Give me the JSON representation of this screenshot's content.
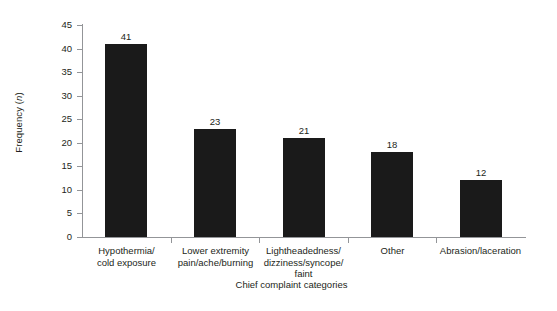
{
  "chart_data": {
    "type": "bar",
    "title": "",
    "subtitle": "",
    "xlabel": "Chief complaint categories",
    "ylabel": "Frequency (n)",
    "ylabel_plain": "Frequency",
    "ylabel_italic_part": "n",
    "categories": [
      "Hypothermia/\ncold exposure",
      "Lower extremity\npain/ache/burning",
      "Lightheadedness/\ndizziness/syncope/\nfaint",
      "Other",
      "Abrasion/laceration"
    ],
    "category_lines": [
      [
        "Hypothermia/",
        "cold exposure"
      ],
      [
        "Lower extremity",
        "pain/ache/burning"
      ],
      [
        "Lightheadedness/",
        "dizziness/syncope/",
        "faint"
      ],
      [
        "Other"
      ],
      [
        "Abrasion/laceration"
      ]
    ],
    "values": [
      41,
      23,
      21,
      18,
      12
    ],
    "value_labels": [
      "41",
      "23",
      "21",
      "18",
      "12"
    ],
    "ylim": [
      0,
      45
    ],
    "ytick_values": [
      0,
      5,
      10,
      15,
      20,
      25,
      30,
      35,
      40,
      45
    ],
    "ytick_labels": [
      "0",
      "5",
      "10",
      "15",
      "20",
      "25",
      "30",
      "35",
      "40",
      "45"
    ],
    "grid": false,
    "legend": null,
    "legend_position": "none",
    "colors": {
      "bar_fill": "#1a1a1a",
      "axis": "#939598",
      "text": "#231f20",
      "background": "#ffffff"
    }
  }
}
